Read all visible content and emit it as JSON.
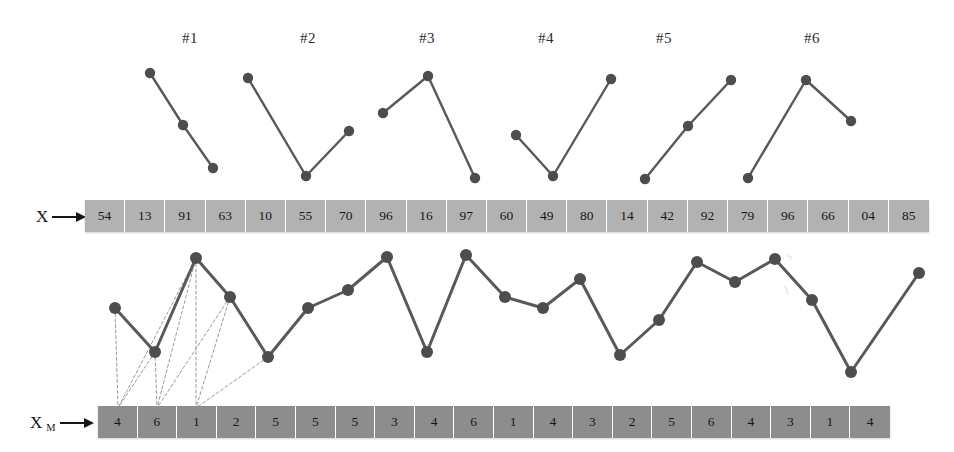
{
  "figure": {
    "title": "",
    "axis_labels": [
      {
        "name": "x-label",
        "text": "X",
        "sub": ""
      },
      {
        "name": "xm-label",
        "text": "X",
        "sub": "M"
      }
    ],
    "group_labels": [
      "#1",
      "#2",
      "#3",
      "#4",
      "#5",
      "#6"
    ],
    "colors": {
      "x_cell_fill": "#b2b2b2",
      "xm_cell_fill": "#8d8d8d",
      "cell_divider": "#ffffff",
      "line": "#595959",
      "marker": "#4d4d4d",
      "dashed_link": "#9a9a9a",
      "text": "#171717",
      "background": "#ffffff"
    },
    "watermarks": [
      "s",
      "1"
    ]
  },
  "chart_data": {
    "type": "line",
    "title": "",
    "xlabel": "",
    "ylabel": "",
    "grid": false,
    "legend": null,
    "series": [
      {
        "name": "X",
        "role": "input-array",
        "values": [
          54,
          13,
          91,
          63,
          10,
          55,
          70,
          96,
          16,
          97,
          60,
          49,
          80,
          14,
          42,
          92,
          79,
          96,
          66,
          4,
          85
        ],
        "labels": [
          "54",
          "13",
          "91",
          "63",
          "10",
          "55",
          "70",
          "96",
          "16",
          "97",
          "60",
          "49",
          "80",
          "14",
          "42",
          "92",
          "79",
          "96",
          "66",
          "04",
          "85"
        ]
      },
      {
        "name": "X_M",
        "role": "mapped-array",
        "values": [
          4,
          6,
          1,
          2,
          5,
          5,
          5,
          3,
          4,
          6,
          1,
          4,
          3,
          2,
          5,
          6,
          4,
          3,
          1,
          4
        ],
        "labels": [
          "4",
          "6",
          "1",
          "2",
          "5",
          "5",
          "5",
          "3",
          "4",
          "6",
          "1",
          "4",
          "3",
          "2",
          "5",
          "6",
          "4",
          "3",
          "1",
          "4"
        ]
      }
    ],
    "main_polyline": {
      "name": "main-signal",
      "n_points": 21,
      "points_px": [
        [
          115,
          308
        ],
        [
          155,
          352
        ],
        [
          196,
          258
        ],
        [
          230,
          297
        ],
        [
          268,
          357
        ],
        [
          308,
          308
        ],
        [
          348,
          290
        ],
        [
          387,
          257
        ],
        [
          427,
          352
        ],
        [
          466,
          255
        ],
        [
          505,
          297
        ],
        [
          543,
          308
        ],
        [
          580,
          279
        ],
        [
          620,
          355
        ],
        [
          659,
          320
        ],
        [
          697,
          262
        ],
        [
          735,
          282
        ],
        [
          775,
          259
        ],
        [
          812,
          300
        ],
        [
          851,
          372
        ],
        [
          919,
          273
        ]
      ]
    },
    "group_polylines": [
      {
        "label": "#1",
        "points_px": [
          [
            150,
            73
          ],
          [
            183,
            125
          ],
          [
            213,
            168
          ]
        ]
      },
      {
        "label": "#2",
        "points_px": [
          [
            248,
            78
          ],
          [
            306,
            176
          ],
          [
            349,
            131
          ]
        ]
      },
      {
        "label": "#3",
        "points_px": [
          [
            383,
            113
          ],
          [
            428,
            76
          ],
          [
            475,
            178
          ]
        ]
      },
      {
        "label": "#4",
        "points_px": [
          [
            516,
            135
          ],
          [
            553,
            176
          ],
          [
            611,
            79
          ]
        ]
      },
      {
        "label": "#5",
        "points_px": [
          [
            645,
            179
          ],
          [
            688,
            126
          ],
          [
            731,
            80
          ]
        ]
      },
      {
        "label": "#6",
        "points_px": [
          [
            748,
            178
          ],
          [
            806,
            80
          ],
          [
            851,
            121
          ]
        ]
      }
    ],
    "dashed_links": [
      [
        [
          115,
          308
        ],
        [
          118,
          408
        ]
      ],
      [
        [
          155,
          352
        ],
        [
          118,
          408
        ]
      ],
      [
        [
          196,
          258
        ],
        [
          118,
          408
        ]
      ],
      [
        [
          155,
          352
        ],
        [
          157,
          408
        ]
      ],
      [
        [
          196,
          258
        ],
        [
          157,
          408
        ]
      ],
      [
        [
          230,
          297
        ],
        [
          157,
          408
        ]
      ],
      [
        [
          196,
          258
        ],
        [
          196,
          408
        ]
      ],
      [
        [
          230,
          297
        ],
        [
          196,
          408
        ]
      ],
      [
        [
          268,
          357
        ],
        [
          196,
          408
        ]
      ]
    ]
  },
  "layout": {
    "x_array": {
      "left": 85,
      "top": 200,
      "width": 844,
      "height": 32,
      "cells": 21
    },
    "xm_array": {
      "left": 98,
      "top": 406,
      "width": 792,
      "height": 32,
      "cells": 20
    },
    "group_label_y": 30,
    "group_label_x": [
      190,
      308,
      427,
      546,
      664,
      812
    ]
  }
}
